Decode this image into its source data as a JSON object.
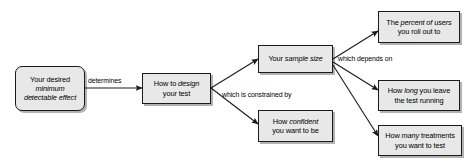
{
  "diagram": {
    "type": "flowchart",
    "background_color": "#ffffff",
    "node_fill_color": "#e8e8e8",
    "node_border_color": "#1a1a1a",
    "text_color": "#000000",
    "nodes": [
      {
        "id": "mde",
        "shape": "rounded-rectangle",
        "lines": [
          {
            "runs": [
              {
                "text": "Your desired",
                "italic": false
              }
            ]
          },
          {
            "runs": [
              {
                "text": "minimum",
                "italic": true
              }
            ]
          },
          {
            "runs": [
              {
                "text": "detectable effect",
                "italic": true
              }
            ]
          }
        ],
        "plain_text": "Your desired minimum detectable effect"
      },
      {
        "id": "design",
        "shape": "rectangle",
        "lines": [
          {
            "runs": [
              {
                "text": "How to ",
                "italic": false
              },
              {
                "text": "design",
                "italic": true
              }
            ]
          },
          {
            "runs": [
              {
                "text": "your test",
                "italic": false
              }
            ]
          }
        ],
        "plain_text": "How to design your test"
      },
      {
        "id": "sample-size",
        "shape": "rectangle",
        "lines": [
          {
            "runs": [
              {
                "text": "Your ",
                "italic": false
              },
              {
                "text": "sample size",
                "italic": true
              }
            ]
          }
        ],
        "plain_text": "Your sample size"
      },
      {
        "id": "confident",
        "shape": "rectangle",
        "lines": [
          {
            "runs": [
              {
                "text": "How ",
                "italic": false
              },
              {
                "text": "confident",
                "italic": true
              }
            ]
          },
          {
            "runs": [
              {
                "text": "you want to be",
                "italic": false
              }
            ]
          }
        ],
        "plain_text": "How confident you want to be"
      },
      {
        "id": "percent-users",
        "shape": "rectangle",
        "lines": [
          {
            "runs": [
              {
                "text": "The ",
                "italic": false
              },
              {
                "text": "percent of users",
                "italic": true
              }
            ]
          },
          {
            "runs": [
              {
                "text": "you roll out to",
                "italic": false
              }
            ]
          }
        ],
        "plain_text": "The percent of users you roll out to"
      },
      {
        "id": "how-long",
        "shape": "rectangle",
        "lines": [
          {
            "runs": [
              {
                "text": "How ",
                "italic": false
              },
              {
                "text": "long",
                "italic": true
              },
              {
                "text": " you leave",
                "italic": false
              }
            ]
          },
          {
            "runs": [
              {
                "text": "the test running",
                "italic": false
              }
            ]
          }
        ],
        "plain_text": "How long you leave the test running"
      },
      {
        "id": "how-many",
        "shape": "rectangle",
        "lines": [
          {
            "runs": [
              {
                "text": "How ",
                "italic": false
              },
              {
                "text": "many",
                "italic": true
              },
              {
                "text": " treatments",
                "italic": false
              }
            ]
          },
          {
            "runs": [
              {
                "text": "you want to test",
                "italic": false
              }
            ]
          }
        ],
        "plain_text": "How many treatments you want to test"
      }
    ],
    "edge_labels": {
      "determines": "determines",
      "constrained": "which is constrained by",
      "depends": "which depends on"
    },
    "edges": [
      {
        "from": "mde",
        "to": "design",
        "label": "determines"
      },
      {
        "from": "design",
        "to": "sample-size",
        "label": "which is constrained by"
      },
      {
        "from": "design",
        "to": "confident",
        "label": "which is constrained by"
      },
      {
        "from": "sample-size",
        "to": "percent-users",
        "label": "which depends on"
      },
      {
        "from": "sample-size",
        "to": "how-long",
        "label": "which depends on"
      },
      {
        "from": "sample-size",
        "to": "how-many",
        "label": "which depends on"
      }
    ]
  }
}
